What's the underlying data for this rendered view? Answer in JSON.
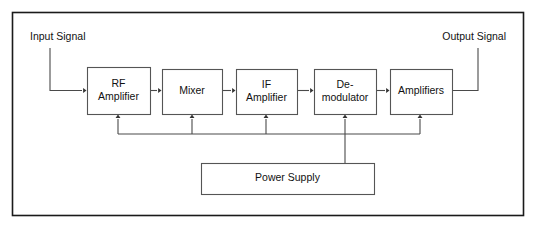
{
  "diagram": {
    "title": "Superheterodyne Receiver Block Diagram",
    "frame": {
      "x": 12,
      "y": 12,
      "width": 511,
      "height": 203
    },
    "colors": {
      "background": "#ffffff",
      "frame_border": "#1a1a1a",
      "block_border": "#555555",
      "wire": "#4a4a4a",
      "text": "#111111"
    },
    "labels": [
      {
        "name": "input-signal-label",
        "text": "Input Signal",
        "x": 30,
        "y": 37,
        "anchor": "start"
      },
      {
        "name": "output-signal-label",
        "text": "Output Signal",
        "x": 506,
        "y": 37,
        "anchor": "end"
      }
    ],
    "blocks": [
      {
        "name": "rf-amplifier-block",
        "lines": [
          "RF",
          "Amplifier"
        ],
        "x": 87,
        "y": 67,
        "width": 63,
        "height": 47
      },
      {
        "name": "mixer-block",
        "lines": [
          "Mixer"
        ],
        "x": 162,
        "y": 69,
        "width": 60,
        "height": 45
      },
      {
        "name": "if-amplifier-block",
        "lines": [
          "IF",
          "Amplifier"
        ],
        "x": 236,
        "y": 69,
        "width": 61,
        "height": 45
      },
      {
        "name": "demodulator-block",
        "lines": [
          "De-",
          "modulator"
        ],
        "x": 314,
        "y": 69,
        "width": 62,
        "height": 45
      },
      {
        "name": "amplifiers-block",
        "lines": [
          "Amplifiers"
        ],
        "x": 390,
        "y": 69,
        "width": 62,
        "height": 45
      },
      {
        "name": "power-supply-block",
        "lines": [
          "Power Supply"
        ],
        "x": 201,
        "y": 163,
        "width": 173,
        "height": 31
      }
    ],
    "signal_wires": [
      {
        "name": "wire-input-to-rf-amplifier",
        "path": "M 50 48 L 50 90.5 L 82 90.5",
        "arrow": {
          "x": 86.5,
          "y": 90.5,
          "dir": "right"
        }
      },
      {
        "name": "wire-rf-amplifier-to-mixer",
        "path": "M 150 90.5 L 157 90.5",
        "arrow": {
          "x": 161.5,
          "y": 90.5,
          "dir": "right"
        }
      },
      {
        "name": "wire-mixer-to-if-amplifier",
        "path": "M 222 90.5 L 231 90.5",
        "arrow": {
          "x": 235.5,
          "y": 90.5,
          "dir": "right"
        }
      },
      {
        "name": "wire-if-amplifier-to-demodulator",
        "path": "M 297 90.5 L 309 90.5",
        "arrow": {
          "x": 313.5,
          "y": 90.5,
          "dir": "right"
        }
      },
      {
        "name": "wire-demodulator-to-amplifiers",
        "path": "M 376 90.5 L 385 90.5",
        "arrow": {
          "x": 389.5,
          "y": 90.5,
          "dir": "right"
        }
      },
      {
        "name": "wire-amplifiers-to-output",
        "path": "M 452 90.5 L 478 90.5 L 478 48",
        "arrow": null
      }
    ],
    "power_wires": [
      {
        "name": "power-bus-horizontal",
        "path": "M 118 134 L 420 134",
        "arrow": null
      },
      {
        "name": "power-feed-rf-amplifier",
        "path": "M 118 134 L 118 119",
        "arrow": {
          "x": 118,
          "y": 114.5,
          "dir": "up"
        }
      },
      {
        "name": "power-feed-mixer",
        "path": "M 192 134 L 192 119",
        "arrow": {
          "x": 192,
          "y": 114.5,
          "dir": "up"
        }
      },
      {
        "name": "power-feed-if-amplifier",
        "path": "M 266 134 L 266 119",
        "arrow": {
          "x": 266,
          "y": 114.5,
          "dir": "up"
        }
      },
      {
        "name": "power-feed-demodulator",
        "path": "M 345 134 L 345 119",
        "arrow": {
          "x": 345,
          "y": 114.5,
          "dir": "up"
        }
      },
      {
        "name": "power-feed-amplifiers",
        "path": "M 420 134 L 420 119",
        "arrow": {
          "x": 420,
          "y": 114.5,
          "dir": "up"
        }
      },
      {
        "name": "power-supply-riser",
        "path": "M 345 163 L 345 134",
        "arrow": null
      }
    ]
  }
}
